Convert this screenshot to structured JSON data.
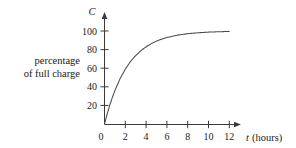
{
  "figure": {
    "side_label_line1": "percentage",
    "side_label_line2": "of full charge",
    "y_axis_name": "C",
    "x_axis_name": "t",
    "x_axis_unit": "(hours)",
    "origin_label": "0"
  },
  "chart_data": {
    "type": "line",
    "title": "",
    "xlabel": "t (hours)",
    "ylabel": "C",
    "ylabel_description": "percentage of full charge",
    "xlim": [
      0,
      13.2
    ],
    "ylim": [
      0,
      108
    ],
    "grid": false,
    "legend": "none",
    "x_ticks": [
      2,
      4,
      6,
      8,
      10,
      12
    ],
    "x_tick_labels": [
      "2",
      "4",
      "6",
      "8",
      "10",
      "12"
    ],
    "y_ticks": [
      20,
      40,
      60,
      80,
      100
    ],
    "y_tick_labels": [
      "20",
      "40",
      "60",
      "80",
      "100"
    ],
    "origin_tick_label": "0",
    "curve_color": "#4a4a4a",
    "axis_color": "#3a3a3a",
    "series": [
      {
        "name": "charge",
        "x": [
          0,
          0.25,
          0.5,
          0.75,
          1,
          1.5,
          2,
          2.5,
          3,
          3.5,
          4,
          4.5,
          5,
          5.5,
          6,
          7,
          8,
          9,
          10,
          11,
          12
        ],
        "values": [
          0,
          10.5,
          20.0,
          28.4,
          36.0,
          48.8,
          59.0,
          67.2,
          73.6,
          78.9,
          83.0,
          86.4,
          89.1,
          91.3,
          93.0,
          95.5,
          97.1,
          98.1,
          98.8,
          99.2,
          99.5
        ]
      }
    ]
  }
}
